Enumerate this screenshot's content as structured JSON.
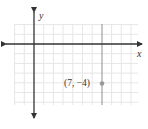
{
  "graph": {
    "x_axis_label": "x",
    "y_axis_label": "y",
    "point_label": "(7, −4)",
    "point": {
      "x": 7,
      "y": -4
    },
    "vertical_line": {
      "x": 7
    },
    "grid": {
      "x_min": -2,
      "x_max": 11,
      "y_min": -6,
      "y_max": 2
    },
    "colors": {
      "grid": "#e6e6e6",
      "axes": "#333333",
      "vertical_line": "#8c8c8c",
      "point": "#9a9a9a"
    }
  }
}
